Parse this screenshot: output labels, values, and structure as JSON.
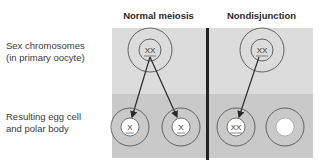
{
  "columns": [
    {
      "title": "Normal meiosis"
    },
    {
      "title": "Nondisjunction"
    }
  ],
  "rows": [
    {
      "label_line1": "Sex chromosomes",
      "label_line2": "(in primary oocyte)"
    },
    {
      "label_line1": "Resulting egg cell",
      "label_line2": "and polar body"
    }
  ],
  "normal": {
    "oocyte_chromosomes": "XX",
    "egg_chromosomes": "X",
    "polar_body_chromosomes": "X"
  },
  "nondisjunction": {
    "oocyte_chromosomes": "XX",
    "egg_chromosomes": "XX",
    "polar_body_chromosomes": ""
  },
  "colors": {
    "top_band": "#dcdcdc",
    "bottom_band": "#c9c9c9",
    "divider": "#222222",
    "circle_stroke": "#555555",
    "arrow": "#2a2a2a",
    "nucleus_fill": "#ffffff"
  }
}
